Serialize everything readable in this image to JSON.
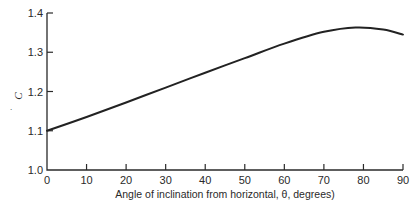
{
  "chart_data": {
    "type": "line",
    "title": "",
    "xlabel": "Angle of inclination from horizontal, θ, degrees)",
    "ylabel": "C",
    "xlim": [
      0,
      90
    ],
    "ylim": [
      1.0,
      1.4
    ],
    "grid": false,
    "legend": null,
    "x_ticks": [
      0,
      10,
      20,
      30,
      40,
      50,
      60,
      70,
      80,
      90
    ],
    "x_tick_labels": [
      "0",
      "10",
      "20",
      "30",
      "40",
      "50",
      "60",
      "70",
      "80",
      "90"
    ],
    "y_ticks": [
      1.0,
      1.1,
      1.2,
      1.3,
      1.4
    ],
    "y_tick_labels": [
      "1.0",
      "1.1",
      "1.2",
      "1.3",
      "1.4"
    ],
    "series": [
      {
        "name": "C",
        "color": "#222222",
        "x": [
          0,
          10,
          20,
          30,
          40,
          50,
          60,
          70,
          78,
          85,
          90
        ],
        "y": [
          1.1,
          1.135,
          1.172,
          1.21,
          1.248,
          1.285,
          1.322,
          1.352,
          1.363,
          1.358,
          1.345
        ]
      }
    ]
  },
  "stray_mark": "."
}
